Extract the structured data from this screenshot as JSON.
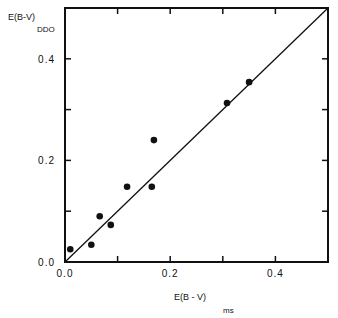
{
  "chart_data": {
    "type": "scatter",
    "title": "",
    "xlabel": "E(B - V)",
    "xlabel_subscript": "ms",
    "ylabel": "E(B-V)",
    "ylabel_subscript": "DDO",
    "xlim": [
      0.0,
      0.5
    ],
    "ylim": [
      0.0,
      0.5
    ],
    "x_ticks": [
      0.0,
      0.1,
      0.2,
      0.3,
      0.4,
      0.5
    ],
    "y_ticks": [
      0.0,
      0.1,
      0.2,
      0.3,
      0.4,
      0.5
    ],
    "x_tick_labels": [
      {
        "value": 0.0,
        "label": "0.0"
      },
      {
        "value": 0.2,
        "label": "0.2"
      },
      {
        "value": 0.4,
        "label": "0.4"
      }
    ],
    "y_tick_labels": [
      {
        "value": 0.0,
        "label": "0.0"
      },
      {
        "value": 0.2,
        "label": "0.2"
      },
      {
        "value": 0.4,
        "label": "0.4"
      }
    ],
    "grid": false,
    "legend": null,
    "series": [
      {
        "name": "stars",
        "marker": "filled-circle",
        "points": [
          {
            "x": 0.01,
            "y": 0.025
          },
          {
            "x": 0.05,
            "y": 0.034
          },
          {
            "x": 0.066,
            "y": 0.09
          },
          {
            "x": 0.087,
            "y": 0.073
          },
          {
            "x": 0.118,
            "y": 0.148
          },
          {
            "x": 0.165,
            "y": 0.148
          },
          {
            "x": 0.169,
            "y": 0.24
          },
          {
            "x": 0.308,
            "y": 0.313
          },
          {
            "x": 0.35,
            "y": 0.354
          }
        ]
      }
    ],
    "reference_line": {
      "name": "one-to-one line",
      "from": [
        0.0,
        0.0
      ],
      "to": [
        0.5,
        0.5
      ]
    },
    "colors": {
      "ink": "#111111",
      "background": "#ffffff"
    }
  }
}
